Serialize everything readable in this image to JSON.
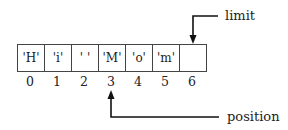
{
  "diagram": {
    "cells": [
      "'H'",
      "'i'",
      "' '",
      "'M'",
      "'o'",
      "'m'",
      ""
    ],
    "indices": [
      "0",
      "1",
      "2",
      "3",
      "4",
      "5",
      "6"
    ],
    "pointers": {
      "limit": {
        "label": "limit",
        "index": 6
      },
      "position": {
        "label": "position",
        "index": 3
      }
    }
  }
}
